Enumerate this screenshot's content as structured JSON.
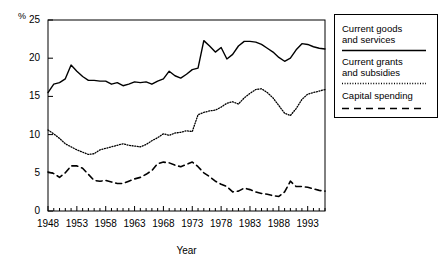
{
  "chart_data": {
    "type": "line",
    "title": "",
    "subtitle": "",
    "xlabel": "Year",
    "ylabel": "%",
    "ylim": [
      0,
      25
    ],
    "xlim": [
      1948,
      1996
    ],
    "yticks": [
      0,
      5,
      10,
      15,
      20,
      25
    ],
    "xticks": [
      1948,
      1953,
      1958,
      1963,
      1968,
      1973,
      1978,
      1983,
      1988,
      1993
    ],
    "grid": false,
    "minor_ticks": "every year",
    "legend_position": "right-outside",
    "x": [
      1948,
      1949,
      1950,
      1951,
      1952,
      1953,
      1954,
      1955,
      1956,
      1957,
      1958,
      1959,
      1960,
      1961,
      1962,
      1963,
      1964,
      1965,
      1966,
      1967,
      1968,
      1969,
      1970,
      1971,
      1972,
      1973,
      1974,
      1975,
      1976,
      1977,
      1978,
      1979,
      1980,
      1981,
      1982,
      1983,
      1984,
      1985,
      1986,
      1987,
      1988,
      1989,
      1990,
      1991,
      1992,
      1993,
      1994,
      1995,
      1996
    ],
    "series": [
      {
        "name": "Current goods and services",
        "style": "solid",
        "color": "#000000",
        "values": [
          15.5,
          16.6,
          16.8,
          17.3,
          19.1,
          18.3,
          17.6,
          17.1,
          17.1,
          17.0,
          17.0,
          16.6,
          16.8,
          16.4,
          16.6,
          16.9,
          16.8,
          16.9,
          16.6,
          17.0,
          17.3,
          18.3,
          17.7,
          17.4,
          17.9,
          18.5,
          18.7,
          22.3,
          21.6,
          20.8,
          21.4,
          19.9,
          20.5,
          21.6,
          22.2,
          22.2,
          22.1,
          21.8,
          21.3,
          20.8,
          20.1,
          19.6,
          20.0,
          21.1,
          21.9,
          21.8,
          21.5,
          21.3,
          21.2
        ]
      },
      {
        "name": "Current grants and subsidies",
        "style": "dotted",
        "color": "#000000",
        "values": [
          10.6,
          10.1,
          9.5,
          8.8,
          8.4,
          8.0,
          7.7,
          7.4,
          7.5,
          8.0,
          8.2,
          8.4,
          8.6,
          8.8,
          8.6,
          8.5,
          8.4,
          8.7,
          9.2,
          9.6,
          10.1,
          9.9,
          10.2,
          10.3,
          10.5,
          10.4,
          12.6,
          12.9,
          13.1,
          13.2,
          13.6,
          14.1,
          14.3,
          14.0,
          14.8,
          15.4,
          15.9,
          16.0,
          15.5,
          14.8,
          13.8,
          12.8,
          12.5,
          13.4,
          14.6,
          15.3,
          15.5,
          15.7,
          15.9
        ]
      },
      {
        "name": "Capital spending",
        "style": "dashed",
        "color": "#000000",
        "values": [
          5.1,
          4.9,
          4.4,
          5.0,
          5.9,
          5.9,
          5.6,
          4.8,
          4.0,
          3.9,
          4.0,
          3.8,
          3.6,
          3.6,
          3.9,
          4.2,
          4.4,
          4.8,
          5.3,
          6.2,
          6.4,
          6.3,
          6.0,
          5.8,
          6.1,
          6.4,
          5.8,
          5.0,
          4.5,
          3.9,
          3.5,
          3.2,
          2.5,
          2.6,
          3.0,
          2.8,
          2.5,
          2.3,
          2.2,
          2.0,
          1.9,
          2.5,
          3.9,
          3.2,
          3.2,
          3.1,
          2.9,
          2.7,
          2.6
        ]
      }
    ]
  },
  "axes": {
    "y_label_text": "%",
    "x_axis_title": "Year"
  },
  "legend": {
    "items": [
      {
        "label_line1": "Current goods",
        "label_line2": "and services",
        "style": "solid"
      },
      {
        "label_line1": "Current grants",
        "label_line2": "and subsidies",
        "style": "dotted"
      },
      {
        "label_line1": "Capital spending",
        "label_line2": "",
        "style": "dashed"
      }
    ]
  }
}
